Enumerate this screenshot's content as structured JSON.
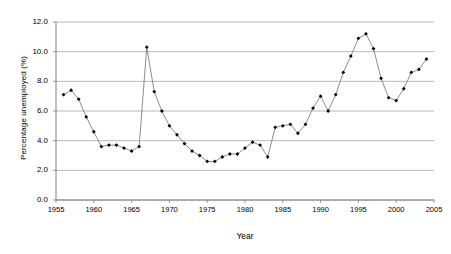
{
  "chart_data": {
    "type": "line",
    "title": "",
    "xlabel": "Year",
    "ylabel": "Percentage unemployed (%)",
    "xlim": [
      1955,
      2005
    ],
    "ylim": [
      0.0,
      12.0
    ],
    "grid": true,
    "legend": "none",
    "marker": "filled-diamond",
    "line_color": "#808080",
    "marker_color": "#000000",
    "y_ticks": [
      "0.0",
      "2.0",
      "4.0",
      "6.0",
      "8.0",
      "10.0",
      "12.0"
    ],
    "y_tick_values": [
      0.0,
      2.0,
      4.0,
      6.0,
      8.0,
      10.0,
      12.0
    ],
    "x_ticks": [
      "1955",
      "1960",
      "1965",
      "1970",
      "1975",
      "1980",
      "1985",
      "1990",
      "1995",
      "2000",
      "2005"
    ],
    "x_tick_values": [
      1955,
      1960,
      1965,
      1970,
      1975,
      1980,
      1985,
      1990,
      1995,
      2000,
      2005
    ],
    "x": [
      1956,
      1957,
      1958,
      1959,
      1960,
      1961,
      1962,
      1963,
      1964,
      1965,
      1966,
      1967,
      1968,
      1969,
      1970,
      1971,
      1972,
      1973,
      1974,
      1975,
      1976,
      1977,
      1978,
      1979,
      1980,
      1981,
      1982,
      1983,
      1984,
      1985,
      1986,
      1987,
      1988,
      1989,
      1990,
      1991,
      1992,
      1993,
      1994,
      1995,
      1996,
      1997,
      1998,
      1999,
      2000,
      2001,
      2002,
      2003,
      2004
    ],
    "y": [
      7.1,
      7.4,
      6.8,
      5.6,
      4.6,
      3.6,
      3.7,
      3.7,
      3.5,
      3.3,
      3.6,
      10.3,
      7.3,
      6.0,
      5.0,
      4.4,
      3.8,
      3.3,
      3.0,
      2.6,
      2.6,
      2.9,
      3.1,
      3.1,
      3.5,
      3.9,
      3.7,
      2.9,
      4.9,
      5.0,
      5.1,
      4.5,
      5.1,
      6.2,
      7.0,
      6.0,
      7.1,
      8.6,
      9.7,
      10.9,
      11.2,
      10.2,
      8.2,
      6.9,
      6.7,
      7.5,
      8.6,
      8.8,
      9.5,
      10.1,
      10.9,
      10.4
    ],
    "series": [
      {
        "name": "Percentage unemployed",
        "points": [
          [
            1956,
            7.1
          ],
          [
            1957,
            7.4
          ],
          [
            1958,
            6.8
          ],
          [
            1959,
            5.6
          ],
          [
            1960,
            4.6
          ],
          [
            1961,
            3.6
          ],
          [
            1962,
            3.7
          ],
          [
            1963,
            3.7
          ],
          [
            1964,
            3.5
          ],
          [
            1965,
            3.3
          ],
          [
            1966,
            3.6
          ],
          [
            1967,
            10.3
          ],
          [
            1968,
            7.3
          ],
          [
            1969,
            6.0
          ],
          [
            1970,
            5.0
          ],
          [
            1971,
            4.4
          ],
          [
            1972,
            3.8
          ],
          [
            1973,
            3.3
          ],
          [
            1974,
            3.0
          ],
          [
            1975,
            2.6
          ],
          [
            1976,
            2.6
          ],
          [
            1977,
            2.9
          ],
          [
            1978,
            3.1
          ],
          [
            1979,
            3.1
          ],
          [
            1980,
            3.5
          ],
          [
            1981,
            3.9
          ],
          [
            1982,
            3.7
          ],
          [
            1983,
            2.9
          ],
          [
            1984,
            4.9
          ],
          [
            1985,
            5.0
          ],
          [
            1986,
            5.1
          ],
          [
            1987,
            4.5
          ],
          [
            1988,
            5.1
          ],
          [
            1989,
            6.2
          ],
          [
            1990,
            7.0
          ],
          [
            1991,
            6.0
          ],
          [
            1992,
            7.1
          ],
          [
            1993,
            8.6
          ],
          [
            1994,
            9.7
          ],
          [
            1995,
            10.9
          ],
          [
            1996,
            11.2
          ],
          [
            1997,
            10.2
          ],
          [
            1998,
            8.2
          ],
          [
            1999,
            6.9
          ],
          [
            2000,
            6.7
          ],
          [
            2001,
            7.5
          ],
          [
            2002,
            8.6
          ],
          [
            2003,
            8.8
          ],
          [
            2004,
            9.5
          ]
        ]
      }
    ]
  }
}
